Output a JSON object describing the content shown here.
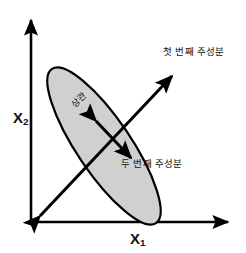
{
  "figure": {
    "title": "",
    "background_color": "#ffffff",
    "axes": {
      "x_label_base": "X",
      "x_label_sub": "1",
      "y_label_base": "X",
      "y_label_sub": "2",
      "line_color": "#000000",
      "origin": [
        31,
        222
      ]
    },
    "ellipse": {
      "fill_color": "#d0d0d0",
      "stroke_color": "#000000",
      "center": [
        104,
        146
      ],
      "semi_major": 93,
      "semi_minor": 27,
      "rotation_deg": -56
    },
    "annotations": {
      "first_principal_component": "첫 번째 주성분",
      "second_principal_component": "두 번째 주성분",
      "spread_label": "상관"
    },
    "arrows": {
      "major_axis_color": "#000000",
      "minor_axis_color": "#000000"
    }
  }
}
